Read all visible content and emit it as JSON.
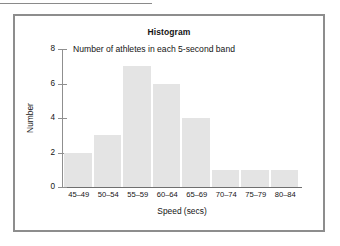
{
  "page": {
    "top_rule": "",
    "background_color": "#ffffff"
  },
  "figure": {
    "border_color": "#8d8d8d",
    "title": "Histogram",
    "subtitle": "Number of athletes in each 5-second band"
  },
  "chart_data": {
    "type": "bar",
    "title": "Histogram",
    "subtitle": "Number of athletes in each 5-second band",
    "xlabel": "Speed (secs)",
    "ylabel": "Number",
    "categories": [
      "45–49",
      "50–54",
      "55–59",
      "60–64",
      "65–69",
      "70–74",
      "75–79",
      "80–84"
    ],
    "values": [
      2,
      3,
      7,
      6,
      4,
      1,
      1,
      1
    ],
    "ylim": [
      0,
      8
    ],
    "yticks": [
      0,
      2,
      4,
      6,
      8
    ],
    "ytick_labels": [
      "0",
      "2",
      "4",
      "6",
      "8"
    ],
    "grid": false,
    "legend": false,
    "bar_color": "#e4e4e4",
    "axis_color": "#8f8f8f"
  }
}
